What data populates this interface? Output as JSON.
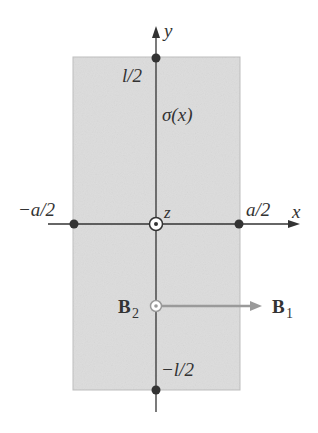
{
  "diagram": {
    "type": "physics-current-sheet",
    "colors": {
      "sheet_fill": "#dcdcdc",
      "sheet_edge": "#b8b8b8",
      "axis": "#333333",
      "point": "#333333",
      "field_arrow": "#9a9a9a",
      "text": "#333333"
    },
    "axes": {
      "x_label": "x",
      "y_label": "y",
      "z_label": "z"
    },
    "labels": {
      "top": "l/2",
      "bottom": "−l/2",
      "left": "−a/2",
      "right": "a/2",
      "charge_density": "σ(x)",
      "field_2_main": "B",
      "field_2_sub": "2",
      "field_1_main": "B",
      "field_1_sub": "1"
    },
    "marked_points": [
      "(0, l/2)",
      "(0, −l/2)",
      "(−a/2, 0)",
      "(a/2, 0)"
    ],
    "out_of_page_symbols": [
      "origin (z-axis)",
      "B2 location"
    ]
  }
}
